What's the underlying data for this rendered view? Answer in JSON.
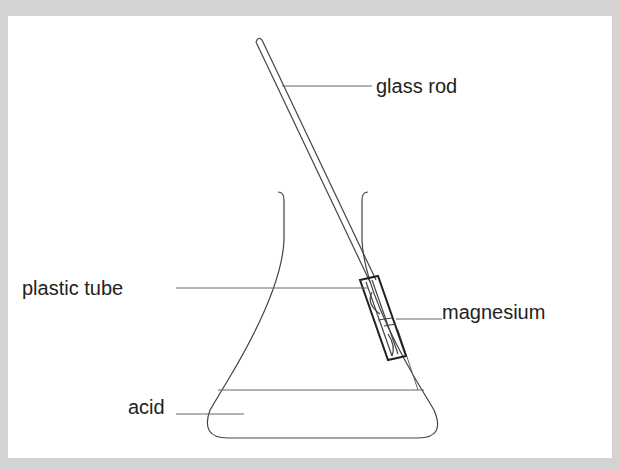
{
  "diagram": {
    "labels": {
      "glass_rod": "glass rod",
      "plastic_tube": "plastic tube",
      "magnesium": "magnesium",
      "acid": "acid"
    },
    "colors": {
      "border": "#d3d3d3",
      "background": "#ffffff",
      "line": "#333333",
      "text": "#222222"
    }
  }
}
